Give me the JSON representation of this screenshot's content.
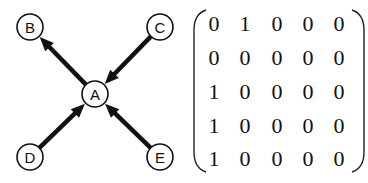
{
  "graph": {
    "nodes": [
      {
        "id": "A",
        "label": "A",
        "x": 95,
        "y": 94
      },
      {
        "id": "B",
        "label": "B",
        "x": 30,
        "y": 27
      },
      {
        "id": "C",
        "label": "C",
        "x": 160,
        "y": 27
      },
      {
        "id": "D",
        "label": "D",
        "x": 30,
        "y": 157
      },
      {
        "id": "E",
        "label": "E",
        "x": 160,
        "y": 157
      }
    ],
    "edges": [
      {
        "from": "A",
        "to": "B"
      },
      {
        "from": "C",
        "to": "A"
      },
      {
        "from": "D",
        "to": "A"
      },
      {
        "from": "E",
        "to": "A"
      }
    ],
    "node_radius": 13,
    "stroke_color": "#111111"
  },
  "matrix": {
    "rows": [
      [
        "0",
        "1",
        "0",
        "0",
        "0"
      ],
      [
        "0",
        "0",
        "0",
        "0",
        "0"
      ],
      [
        "1",
        "0",
        "0",
        "0",
        "0"
      ],
      [
        "1",
        "0",
        "0",
        "0",
        "0"
      ],
      [
        "1",
        "0",
        "0",
        "0",
        "0"
      ]
    ]
  }
}
